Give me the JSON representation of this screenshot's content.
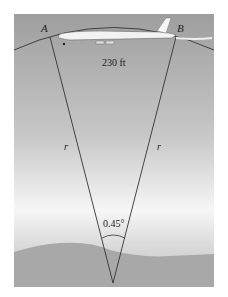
{
  "diagram": {
    "point_a": "A",
    "point_b": "B",
    "arc_length": "230 ft",
    "radius_left": "r",
    "radius_right": "r",
    "central_angle": "0.45°"
  }
}
